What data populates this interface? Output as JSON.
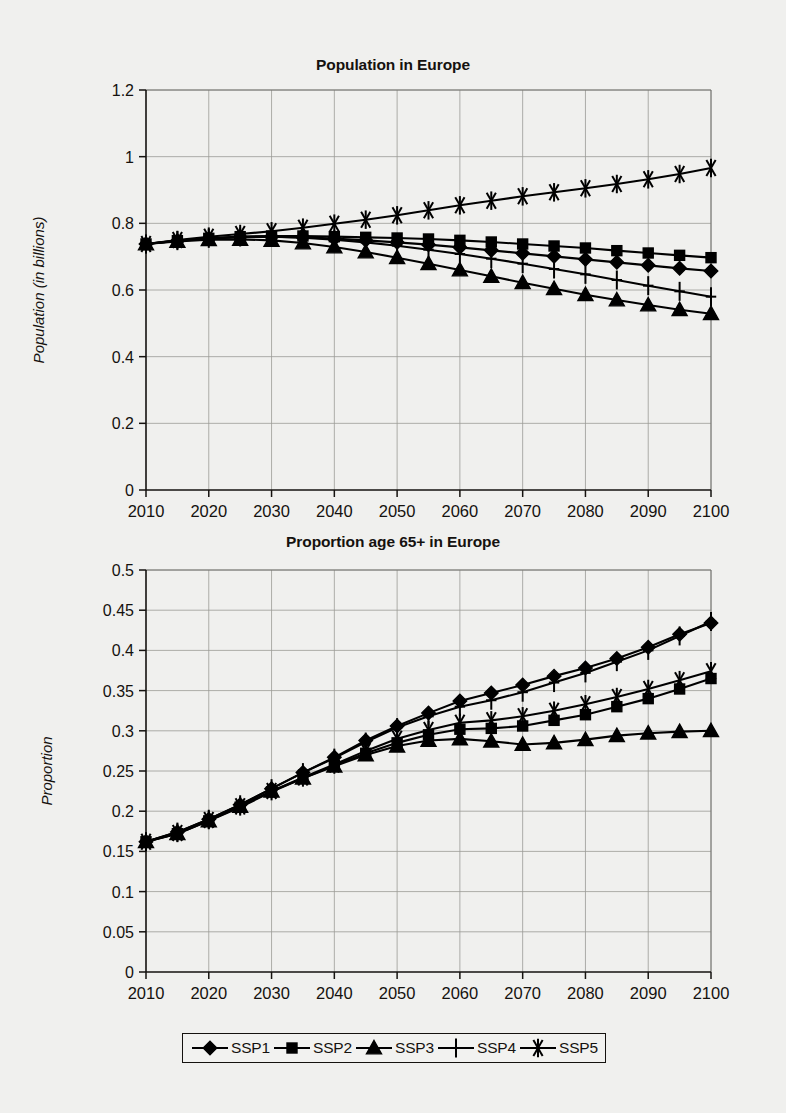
{
  "figure": {
    "background_color": "#f0f0ee",
    "ink_color": "#15120f",
    "grid_color": "#9a9a96"
  },
  "legend": {
    "position": "bottom-center",
    "entries": [
      {
        "label": "SSP1",
        "marker": "diamond-marker"
      },
      {
        "label": "SSP2",
        "marker": "square-marker"
      },
      {
        "label": "SSP3",
        "marker": "triangle-marker"
      },
      {
        "label": "SSP4",
        "marker": "plus-marker"
      },
      {
        "label": "SSP5",
        "marker": "asterisk-marker"
      }
    ]
  },
  "chart_data": [
    {
      "type": "line",
      "title": "Population in Europe",
      "xlabel": "",
      "ylabel": "Population (in billions)",
      "xlim": [
        2010,
        2100
      ],
      "ylim": [
        0,
        1.2
      ],
      "yticks": [
        0,
        0.2,
        0.4,
        0.6,
        0.8,
        1,
        1.2
      ],
      "ytick_labels": [
        "0",
        "0.2",
        "0.4",
        "0.6",
        "0.8",
        "1",
        "1.2"
      ],
      "xticks": [
        2010,
        2020,
        2030,
        2040,
        2050,
        2060,
        2070,
        2080,
        2090,
        2100
      ],
      "xtick_labels": [
        "2010",
        "2020",
        "2030",
        "2040",
        "2050",
        "2060",
        "2070",
        "2080",
        "2090",
        "2100"
      ],
      "grid": true,
      "legend_position": "bottom",
      "x": [
        2010,
        2015,
        2020,
        2025,
        2030,
        2035,
        2040,
        2045,
        2050,
        2055,
        2060,
        2065,
        2070,
        2075,
        2080,
        2085,
        2090,
        2095,
        2100
      ],
      "series": [
        {
          "name": "SSP1",
          "marker": "diamond-marker",
          "values": [
            0.738,
            0.747,
            0.754,
            0.759,
            0.76,
            0.758,
            0.754,
            0.749,
            0.743,
            0.736,
            0.728,
            0.719,
            0.71,
            0.701,
            0.692,
            0.683,
            0.674,
            0.665,
            0.657
          ]
        },
        {
          "name": "SSP2",
          "marker": "square-marker",
          "values": [
            0.738,
            0.748,
            0.755,
            0.76,
            0.762,
            0.762,
            0.76,
            0.758,
            0.756,
            0.753,
            0.749,
            0.744,
            0.738,
            0.732,
            0.726,
            0.718,
            0.711,
            0.704,
            0.697
          ]
        },
        {
          "name": "SSP3",
          "marker": "triangle-marker",
          "values": [
            0.738,
            0.746,
            0.751,
            0.752,
            0.749,
            0.741,
            0.729,
            0.714,
            0.697,
            0.679,
            0.66,
            0.641,
            0.622,
            0.604,
            0.586,
            0.57,
            0.555,
            0.541,
            0.529
          ]
        },
        {
          "name": "SSP4",
          "marker": "plus-marker",
          "values": [
            0.738,
            0.748,
            0.755,
            0.759,
            0.76,
            0.757,
            0.751,
            0.743,
            0.733,
            0.721,
            0.708,
            0.694,
            0.679,
            0.663,
            0.647,
            0.63,
            0.613,
            0.596,
            0.58
          ]
        },
        {
          "name": "SSP5",
          "marker": "asterisk-marker",
          "values": [
            0.738,
            0.75,
            0.76,
            0.768,
            0.776,
            0.787,
            0.799,
            0.811,
            0.824,
            0.839,
            0.854,
            0.868,
            0.881,
            0.893,
            0.905,
            0.918,
            0.932,
            0.948,
            0.966
          ]
        }
      ]
    },
    {
      "type": "line",
      "title": "Proportion age 65+ in Europe",
      "xlabel": "",
      "ylabel": "Proportion",
      "xlim": [
        2010,
        2100
      ],
      "ylim": [
        0,
        0.5
      ],
      "yticks": [
        0,
        0.05,
        0.1,
        0.15,
        0.2,
        0.25,
        0.3,
        0.35,
        0.4,
        0.45,
        0.5
      ],
      "ytick_labels": [
        "0",
        "0.05",
        "0.1",
        "0.15",
        "0.2",
        "0.25",
        "0.3",
        "0.35",
        "0.4",
        "0.45",
        "0.5"
      ],
      "xticks": [
        2010,
        2020,
        2030,
        2040,
        2050,
        2060,
        2070,
        2080,
        2090,
        2100
      ],
      "xtick_labels": [
        "2010",
        "2020",
        "2030",
        "2040",
        "2050",
        "2060",
        "2070",
        "2080",
        "2090",
        "2100"
      ],
      "grid": true,
      "legend_position": "bottom",
      "x": [
        2010,
        2015,
        2020,
        2025,
        2030,
        2035,
        2040,
        2045,
        2050,
        2055,
        2060,
        2065,
        2070,
        2075,
        2080,
        2085,
        2090,
        2095,
        2100
      ],
      "series": [
        {
          "name": "SSP1",
          "marker": "diamond-marker",
          "values": [
            0.162,
            0.174,
            0.19,
            0.208,
            0.228,
            0.248,
            0.267,
            0.288,
            0.306,
            0.322,
            0.337,
            0.347,
            0.357,
            0.368,
            0.378,
            0.39,
            0.404,
            0.42,
            0.434
          ]
        },
        {
          "name": "SSP2",
          "marker": "square-marker",
          "values": [
            0.162,
            0.172,
            0.188,
            0.205,
            0.224,
            0.241,
            0.257,
            0.272,
            0.285,
            0.295,
            0.302,
            0.303,
            0.306,
            0.313,
            0.32,
            0.33,
            0.34,
            0.352,
            0.365
          ]
        },
        {
          "name": "SSP3",
          "marker": "triangle-marker",
          "values": [
            0.162,
            0.172,
            0.188,
            0.206,
            0.225,
            0.241,
            0.256,
            0.27,
            0.281,
            0.288,
            0.29,
            0.287,
            0.283,
            0.285,
            0.289,
            0.294,
            0.297,
            0.299,
            0.3
          ]
        },
        {
          "name": "SSP4",
          "marker": "plus-marker",
          "values": [
            0.162,
            0.174,
            0.19,
            0.208,
            0.228,
            0.248,
            0.266,
            0.286,
            0.304,
            0.318,
            0.33,
            0.338,
            0.348,
            0.36,
            0.372,
            0.386,
            0.4,
            0.418,
            0.436
          ]
        },
        {
          "name": "SSP5",
          "marker": "asterisk-marker",
          "values": [
            0.162,
            0.173,
            0.189,
            0.206,
            0.225,
            0.242,
            0.258,
            0.275,
            0.29,
            0.301,
            0.31,
            0.313,
            0.318,
            0.325,
            0.333,
            0.342,
            0.352,
            0.363,
            0.374
          ]
        }
      ]
    }
  ]
}
